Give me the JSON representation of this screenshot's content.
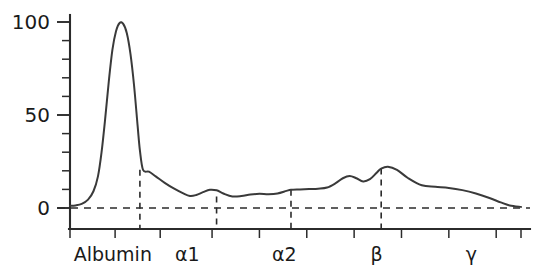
{
  "chart_data": {
    "type": "line",
    "title": "",
    "subtitle": "",
    "xlabel": "",
    "ylabel": "",
    "grid": false,
    "legend": "none",
    "xlim": [
      0,
      100
    ],
    "ylim": [
      -8,
      108
    ],
    "y_axis": {
      "tick_labels": [
        "0",
        "50",
        "100"
      ],
      "tick_values": [
        0,
        50,
        100
      ],
      "minor_tick_step": 10,
      "minor_tick_values": [
        0,
        10,
        20,
        30,
        40,
        50,
        60,
        70,
        80,
        90,
        100
      ]
    },
    "x_axis": {
      "region_labels": [
        "Albumin",
        "α1",
        "α2",
        "β",
        "γ"
      ],
      "region_label_positions": [
        9.5,
        26.0,
        47.5,
        68.0,
        89.0
      ],
      "tick_values": [
        0.0,
        10.0,
        20.0,
        31.5,
        42.0,
        52.5,
        63.0,
        73.5,
        84.0,
        94.5,
        100.0
      ],
      "divider_values": [
        15.5,
        32.5,
        49.0,
        69.0
      ],
      "baseline_value": 0
    },
    "series": [
      {
        "name": "densitometry-trace",
        "color": "#3a3a3a",
        "x": [
          0.0,
          1.2,
          2.6,
          4.0,
          5.2,
          6.2,
          7.0,
          7.8,
          8.6,
          9.4,
          10.2,
          11.0,
          11.8,
          12.6,
          13.4,
          14.2,
          15.0,
          15.5,
          16.2,
          17.5,
          19.0,
          21.0,
          23.0,
          25.0,
          26.6,
          28.0,
          29.5,
          31.0,
          32.5,
          34.0,
          36.0,
          38.0,
          40.0,
          42.0,
          44.0,
          46.0,
          48.0,
          49.0,
          51.0,
          53.0,
          55.0,
          57.0,
          59.0,
          60.5,
          62.0,
          63.5,
          65.0,
          66.5,
          68.0,
          69.0,
          70.5,
          72.5,
          75.0,
          78.0,
          81.0,
          84.0,
          87.0,
          90.0,
          93.0,
          95.5,
          97.5,
          100.0
        ],
        "y": [
          1.2,
          1.4,
          2.2,
          4.5,
          9.0,
          17.0,
          30.0,
          48.0,
          68.0,
          85.0,
          95.0,
          99.5,
          99.0,
          94.0,
          83.0,
          66.0,
          44.0,
          31.0,
          20.5,
          19.5,
          17.0,
          13.5,
          10.5,
          8.0,
          6.5,
          7.0,
          8.5,
          9.8,
          9.5,
          7.8,
          6.2,
          6.4,
          7.2,
          7.6,
          7.4,
          7.8,
          9.2,
          9.8,
          10.0,
          10.2,
          10.4,
          11.0,
          13.5,
          16.0,
          17.2,
          16.0,
          14.3,
          15.5,
          19.0,
          21.2,
          22.2,
          20.5,
          16.0,
          12.2,
          11.4,
          10.8,
          9.6,
          7.8,
          5.4,
          3.0,
          1.4,
          0.6
        ]
      }
    ],
    "annotations": {
      "baseline_dashed": true,
      "region_dividers_dashed": true,
      "divider_top_values": [
        20.5,
        6.2,
        9.8,
        21.2
      ]
    }
  },
  "regions": [
    {
      "name": "albumin",
      "label": "Albumin"
    },
    {
      "name": "alpha1",
      "label": "α1"
    },
    {
      "name": "alpha2",
      "label": "α2"
    },
    {
      "name": "beta",
      "label": "β"
    },
    {
      "name": "gamma",
      "label": "γ"
    }
  ],
  "colors": {
    "trace": "#3a3a3a",
    "axis": "#2b2b2b",
    "text": "#1a1a1a",
    "background": "#ffffff"
  }
}
